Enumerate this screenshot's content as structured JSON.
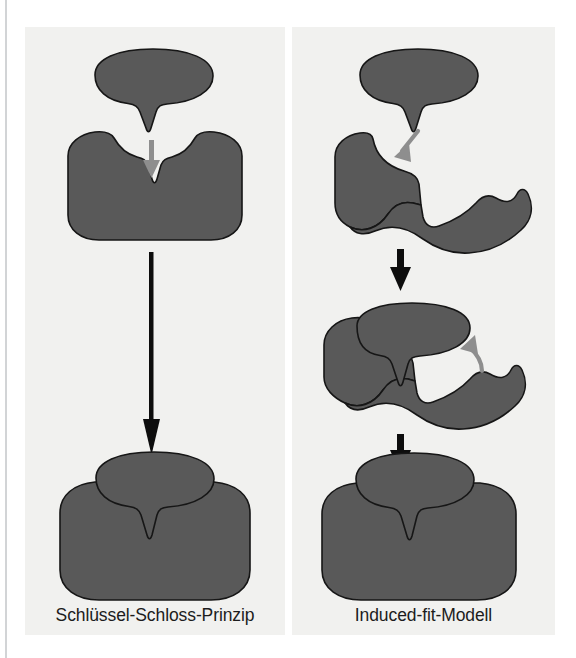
{
  "figure": {
    "background_color": "#ffffff",
    "panel_background_color": "#f1f1ef",
    "shape_fill_color": "#595959",
    "shape_outline_color": "#161616",
    "gray_arrow_color": "#8e8e8e",
    "black_arrow_color": "#0d0d0d",
    "caption_color": "#1c1c1c"
  },
  "panels": [
    {
      "id": "left",
      "caption": "Schlüssel-Schloss-Prinzip",
      "stages": [
        {
          "name": "substrate-and-enzyme-before-binding",
          "elements": [
            "substrate-key-shape",
            "enzyme-lock-shape",
            "gray-down-arrow"
          ]
        },
        {
          "name": "enzyme-substrate-complex",
          "elements": [
            "bound-complex-shape"
          ]
        }
      ],
      "connectors": [
        "long-black-down-arrow"
      ]
    },
    {
      "id": "right",
      "caption": "Induced-fit-Modell",
      "stages": [
        {
          "name": "substrate-approaching-unfitted-enzyme",
          "elements": [
            "substrate-key-shape",
            "enzyme-open-shape",
            "gray-diagonal-arrow"
          ]
        },
        {
          "name": "enzyme-adapting-to-substrate",
          "elements": [
            "substrate-key-shape",
            "enzyme-adapting-shape",
            "gray-curved-arrow"
          ]
        },
        {
          "name": "enzyme-substrate-complex",
          "elements": [
            "bound-complex-shape"
          ]
        }
      ],
      "connectors": [
        "black-down-arrow-1",
        "black-down-arrow-2"
      ]
    }
  ],
  "captions": {
    "left": "Schlüssel-Schloss-Prinzip",
    "right": "Induced-fit-Modell"
  }
}
